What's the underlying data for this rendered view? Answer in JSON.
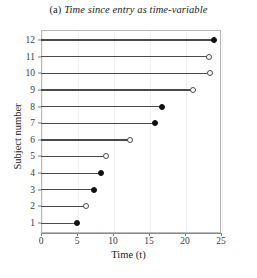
{
  "title": {
    "label": "(a)",
    "text": "Time since entry as time-variable"
  },
  "chart_data": {
    "type": "scatter",
    "title": "(a) Time since entry as time-variable",
    "xlabel": "Time (t)",
    "ylabel": "Subject number",
    "xlim": [
      0,
      25
    ],
    "ylim": [
      0.4,
      12.6
    ],
    "xticks": [
      "0",
      "5",
      "10",
      "15",
      "20",
      "25"
    ],
    "xtick_values": [
      0,
      5,
      10,
      15,
      20,
      25
    ],
    "yticks": [
      "1",
      "2",
      "3",
      "4",
      "5",
      "6",
      "7",
      "8",
      "9",
      "10",
      "11",
      "12"
    ],
    "ytick_values": [
      1,
      2,
      3,
      4,
      5,
      6,
      7,
      8,
      9,
      10,
      11,
      12
    ],
    "grid": "vertical-light",
    "legend": "none",
    "marker_legend": {
      "filled": "event (failure)",
      "open": "censored"
    },
    "series": [
      {
        "name": "Subject 1",
        "subject": 1,
        "start": 0,
        "stop": 5.0,
        "status": "filled"
      },
      {
        "name": "Subject 2",
        "subject": 2,
        "start": 0,
        "stop": 6.2,
        "status": "open"
      },
      {
        "name": "Subject 3",
        "subject": 3,
        "start": 0,
        "stop": 7.3,
        "status": "filled"
      },
      {
        "name": "Subject 4",
        "subject": 4,
        "start": 0,
        "stop": 8.3,
        "status": "filled"
      },
      {
        "name": "Subject 5",
        "subject": 5,
        "start": 0,
        "stop": 9.0,
        "status": "open"
      },
      {
        "name": "Subject 6",
        "subject": 6,
        "start": 0,
        "stop": 12.3,
        "status": "open"
      },
      {
        "name": "Subject 7",
        "subject": 7,
        "start": 0,
        "stop": 15.8,
        "status": "filled"
      },
      {
        "name": "Subject 8",
        "subject": 8,
        "start": 0,
        "stop": 16.8,
        "status": "filled"
      },
      {
        "name": "Subject 9",
        "subject": 9,
        "start": 0,
        "stop": 21.1,
        "status": "open"
      },
      {
        "name": "Subject 10",
        "subject": 10,
        "start": 0,
        "stop": 23.5,
        "status": "open"
      },
      {
        "name": "Subject 11",
        "subject": 11,
        "start": 0,
        "stop": 23.3,
        "status": "open"
      },
      {
        "name": "Subject 12",
        "subject": 12,
        "start": 0,
        "stop": 24.0,
        "status": "filled"
      }
    ]
  }
}
